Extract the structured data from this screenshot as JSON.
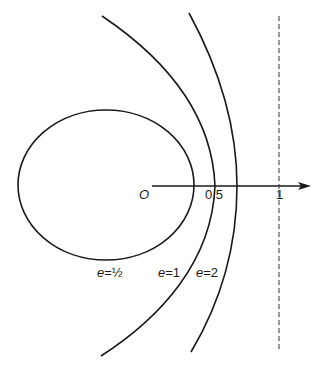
{
  "diagram": {
    "axis": {
      "origin_label": "O",
      "ticks": [
        {
          "label": "0.5",
          "value": 0.5
        },
        {
          "label": "1",
          "value": 1
        }
      ]
    },
    "curves": [
      {
        "name": "ellipse",
        "label_var": "e",
        "label_eq": "=",
        "label_val": "½"
      },
      {
        "name": "parabola",
        "label_var": "e",
        "label_eq": "=",
        "label_val": "1"
      },
      {
        "name": "hyperbola",
        "label_var": "e",
        "label_eq": "=",
        "label_val": "2"
      }
    ],
    "directrix": {
      "label": "1",
      "style": "dashed"
    },
    "colors": {
      "ink": "#1a1a1a",
      "background": "#ffffff"
    }
  }
}
